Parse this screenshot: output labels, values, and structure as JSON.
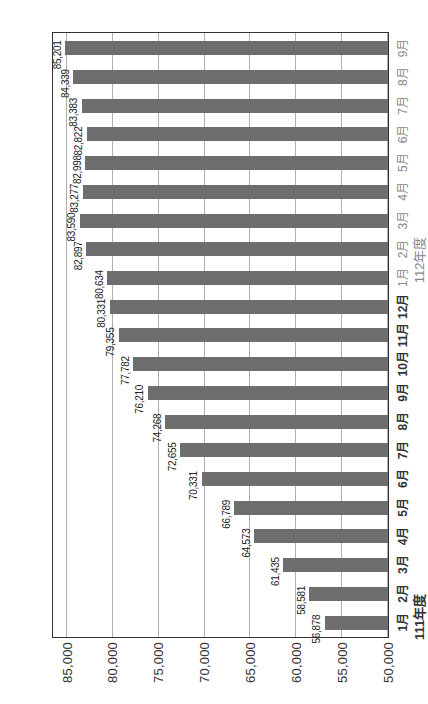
{
  "chart_data": {
    "type": "bar",
    "orientation": "rotated-90-ccw",
    "title": "",
    "xlabel": "",
    "ylabel": "",
    "ylim": [
      50000,
      85000
    ],
    "yticks": [
      "50,000",
      "55,000",
      "60,000",
      "65,000",
      "70,000",
      "75,000",
      "80,000",
      "85,000"
    ],
    "grid": true,
    "legend": null,
    "bar_color": "#6e6e6e",
    "groups": [
      {
        "label": "111年度",
        "color": "#333333",
        "months": [
          "1月",
          "2月",
          "3月",
          "4月",
          "5月",
          "6月",
          "7月",
          "8月",
          "9月",
          "10月",
          "11月",
          "12月"
        ]
      },
      {
        "label": "112年度",
        "color": "#888888",
        "months": [
          "1月",
          "2月",
          "3月",
          "4月",
          "5月",
          "6月",
          "7月",
          "8月",
          "9月"
        ]
      }
    ],
    "categories": [
      "111年度 1月",
      "111年度 2月",
      "111年度 3月",
      "111年度 4月",
      "111年度 5月",
      "111年度 6月",
      "111年度 7月",
      "111年度 8月",
      "111年度 9月",
      "111年度 10月",
      "111年度 11月",
      "111年度 12月",
      "112年度 1月",
      "112年度 2月",
      "112年度 3月",
      "112年度 4月",
      "112年度 5月",
      "112年度 6月",
      "112年度 7月",
      "112年度 8月",
      "112年度 9月"
    ],
    "values": [
      56878,
      58581,
      61435,
      64573,
      66789,
      70331,
      72655,
      74268,
      76210,
      77782,
      79355,
      80331,
      80634,
      82897,
      83590,
      83277,
      82998,
      82822,
      83383,
      84339,
      85201
    ],
    "value_labels": [
      "56,878",
      "58,581",
      "61,435",
      "64,573",
      "66,789",
      "70,331",
      "72,655",
      "74,268",
      "76,210",
      "77,782",
      "79,355",
      "80,331",
      "80,634",
      "82,897",
      "83,590",
      "83,277",
      "82,998",
      "82,822",
      "83,383",
      "84,339",
      "85,201"
    ]
  }
}
